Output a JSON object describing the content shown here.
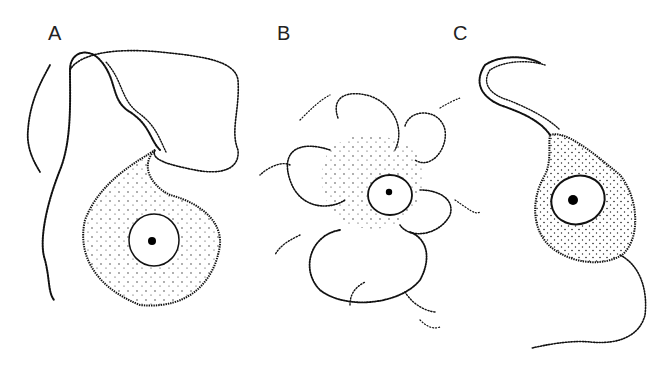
{
  "figure": {
    "panels": [
      {
        "label": "A",
        "description": "cell with single long flagellum"
      },
      {
        "label": "B",
        "description": "amoeboid cell with many pseudopodia"
      },
      {
        "label": "C",
        "description": "flagellated cell with two flagella"
      }
    ]
  }
}
